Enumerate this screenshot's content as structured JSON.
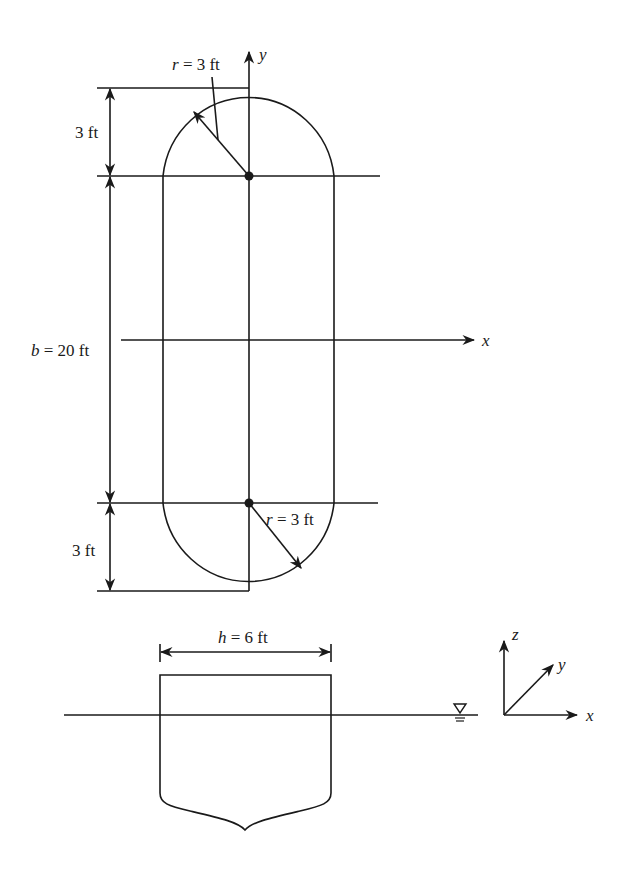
{
  "figure": {
    "plan_view": {
      "top_radius_label_var": "r",
      "top_radius_label_eq": " = 3 ft",
      "bottom_radius_label_var": "r",
      "bottom_radius_label_eq": " = 3 ft",
      "top_cap_dimension": "3 ft",
      "bottom_cap_dimension": "3 ft",
      "length_label_var": "b",
      "length_label_eq": " = 20 ft",
      "x_axis_label": "x",
      "y_axis_label": "y"
    },
    "section_view": {
      "width_label_var": "h",
      "width_label_eq": " = 6 ft",
      "water_surface_symbol": "∇"
    },
    "axes_triad": {
      "x_label": "x",
      "y_label": "y",
      "z_label": "z"
    },
    "colors": {
      "line": "#1a1a1a",
      "background": "#ffffff"
    }
  }
}
